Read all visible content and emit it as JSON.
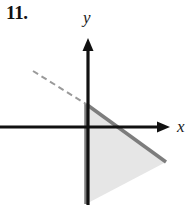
{
  "figure": {
    "problem_number": "11.",
    "background_color": "#ffffff",
    "axes": {
      "x_label": "x",
      "y_label": "y",
      "axis_color": "#111111",
      "x_axis": {
        "y": 127,
        "x_start": 0,
        "x_end": 170,
        "arrow": "right"
      },
      "y_axis": {
        "x": 88,
        "y_start": 38,
        "y_end": 205,
        "arrow": "up"
      },
      "origin": {
        "x": 88,
        "y": 127
      }
    },
    "dashed_line": {
      "color": "#9a9a9a",
      "x1": 33,
      "y1": 71,
      "x2": 86,
      "y2": 104
    },
    "region": {
      "fill_color": "#e6e6e6",
      "edge_color": "#7d7d7d",
      "edge_width": 3.5,
      "vertices": [
        {
          "x": 86,
          "y": 104
        },
        {
          "x": 166,
          "y": 162
        },
        {
          "x": 86,
          "y": 204
        }
      ]
    }
  },
  "chart_data": {
    "type": "scatter",
    "title": "11.",
    "xlabel": "x",
    "ylabel": "y",
    "grid": false,
    "legend": null,
    "annotations": [
      "Shaded triangular region in fourth quadrant bounded above by a line through the y-axis at a negative intercept",
      "Dashed ray extends the boundary line up and to the left above the x-axis"
    ]
  }
}
